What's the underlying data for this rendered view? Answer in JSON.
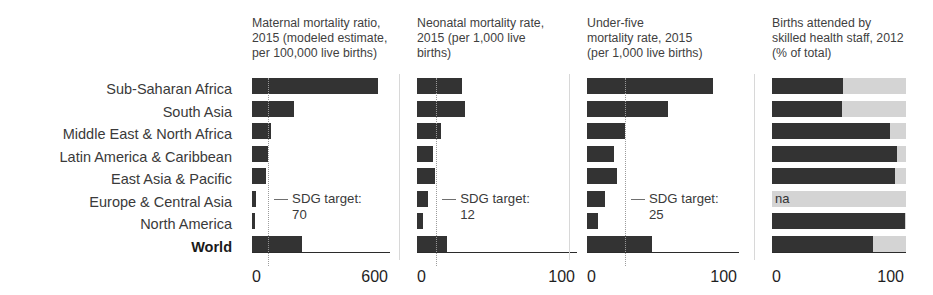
{
  "chart_data": {
    "type": "bar",
    "title": "",
    "orientation": "horizontal",
    "categories": [
      "Sub-Saharan Africa",
      "South Asia",
      "Middle East & North Africa",
      "Latin America & Caribbean",
      "East Asia & Pacific",
      "Europe & Central Asia",
      "North America",
      "World"
    ],
    "highlight_category": "World",
    "grid": false,
    "legend": "none",
    "panels": [
      {
        "title": "Maternal mortality ratio,\n2015 (modeled estimate,\nper 100,000 live births)",
        "xlabel": "",
        "ylabel": "",
        "xlim": [
          0,
          600
        ],
        "ticks": [
          "0",
          "600"
        ],
        "tick_values": [
          0,
          600
        ],
        "target_label": "SDG target:\n70",
        "target_value": 70,
        "values": [
          547,
          182,
          81,
          68,
          62,
          16,
          13,
          216
        ],
        "na": []
      },
      {
        "title": "Neonatal mortality rate,\n2015 (per 1,000 live\nbirths)",
        "xlabel": "",
        "ylabel": "",
        "xlim": [
          0,
          100
        ],
        "ticks": [
          "0",
          "100"
        ],
        "tick_values": [
          0,
          100
        ],
        "target_label": "SDG target:\n12",
        "target_value": 12,
        "values": [
          28,
          30,
          15,
          10,
          11,
          7,
          4,
          19
        ],
        "na": []
      },
      {
        "title": "Under-five\nmortality rate, 2015\n(per 1,000 live births)",
        "xlabel": "",
        "ylabel": "",
        "xlim": [
          0,
          100
        ],
        "ticks": [
          "0",
          "100"
        ],
        "tick_values": [
          0,
          100
        ],
        "target_label": "SDG target:\n25",
        "target_value": 25,
        "values": [
          83,
          53,
          25,
          18,
          20,
          12,
          7,
          43
        ],
        "na": []
      },
      {
        "title": "Births attended by\nskilled health staff, 2012\n(% of total)",
        "xlabel": "",
        "ylabel": "",
        "xlim": [
          0,
          100
        ],
        "ticks": [
          "0",
          "100"
        ],
        "tick_values": [
          0,
          100
        ],
        "target_label": "",
        "target_value": null,
        "values": [
          53,
          52,
          88,
          93,
          92,
          null,
          99,
          75
        ],
        "na": [
          "Europe & Central Asia"
        ],
        "na_label": "na",
        "track_full_scale": true
      }
    ],
    "colors": {
      "bar": "#333333",
      "track": "#d4d4d4",
      "target_line": "#9a9a9a",
      "text": "#3a3a3a",
      "axis": "#2b2b2b"
    }
  }
}
